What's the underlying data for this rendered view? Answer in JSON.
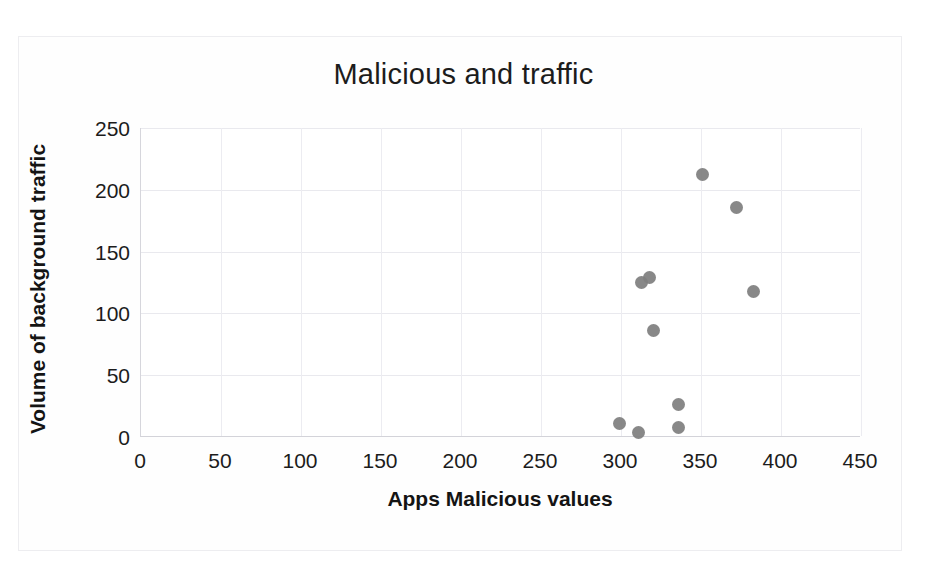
{
  "chart_data": {
    "type": "scatter",
    "title": "Malicious and traffic",
    "xlabel": "Apps Malicious values",
    "ylabel": "Volume of background traffic",
    "xlim": [
      0,
      450
    ],
    "ylim": [
      0,
      250
    ],
    "xticks": [
      0,
      50,
      100,
      150,
      200,
      250,
      300,
      350,
      400,
      450
    ],
    "yticks": [
      0,
      50,
      100,
      150,
      200,
      250
    ],
    "grid": true,
    "legend": null,
    "marker": {
      "shape": "circle",
      "color": "#7f7f7f",
      "size": 13
    },
    "series": [
      {
        "name": "Apps",
        "points": [
          {
            "x": 299,
            "y": 11
          },
          {
            "x": 311,
            "y": 4
          },
          {
            "x": 313,
            "y": 125
          },
          {
            "x": 318,
            "y": 129
          },
          {
            "x": 320,
            "y": 86
          },
          {
            "x": 336,
            "y": 26
          },
          {
            "x": 336,
            "y": 8
          },
          {
            "x": 351,
            "y": 212
          },
          {
            "x": 372,
            "y": 186
          },
          {
            "x": 383,
            "y": 118
          }
        ]
      }
    ]
  },
  "colors": {
    "marker": "#7f7f7f",
    "grid": "#e9e9ee",
    "axis": "#d3d3d9",
    "text": "#1c1c1c",
    "background": "#ffffff"
  }
}
